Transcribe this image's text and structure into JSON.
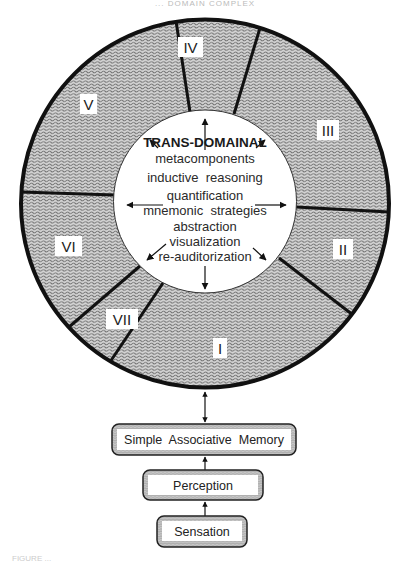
{
  "header": {
    "text": "... DOMAIN COMPLEX"
  },
  "diagram": {
    "outer_ring": {
      "sectors": [
        {
          "id": "I",
          "label": "I"
        },
        {
          "id": "II",
          "label": "II"
        },
        {
          "id": "III",
          "label": "III"
        },
        {
          "id": "IV",
          "label": "IV"
        },
        {
          "id": "V",
          "label": "V"
        },
        {
          "id": "VI",
          "label": "VI"
        },
        {
          "id": "VII",
          "label": "VII"
        }
      ]
    },
    "core": {
      "title": "TRANS-DOMAINAL",
      "items": [
        "metacomponents",
        "inductive  reasoning",
        "quantification",
        "mnemonic  strategies",
        "abstraction",
        "visualization",
        "re-auditorization"
      ]
    },
    "foundation": {
      "boxes": [
        {
          "label": "Simple  Associative  Memory"
        },
        {
          "label": "Perception"
        },
        {
          "label": "Sensation"
        }
      ]
    }
  },
  "caption": {
    "text": "FIGURE ..."
  },
  "colors": {
    "ring_fill": "#bdbdbd",
    "wave_stroke": "#6e6e6e",
    "outline": "#111111",
    "core_fill": "#ffffff"
  }
}
